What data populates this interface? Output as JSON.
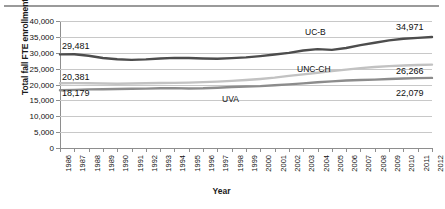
{
  "chart_data": {
    "type": "line",
    "title": "",
    "xlabel": "Year",
    "ylabel": "Total fall FTE enrollment",
    "ylim": [
      0,
      40000
    ],
    "ytick_labels": [
      "0",
      "5,000",
      "10,000",
      "15,000",
      "20,000",
      "25,000",
      "30,000",
      "35,000",
      "40,000"
    ],
    "ytick_values": [
      0,
      5000,
      10000,
      15000,
      20000,
      25000,
      30000,
      35000,
      40000
    ],
    "grid": true,
    "legend_position": "inline-annotations",
    "categories": [
      "1986",
      "1987",
      "1988",
      "1989",
      "1990",
      "1991",
      "1992",
      "1993",
      "1994",
      "1995",
      "1996",
      "1997",
      "1998",
      "1999",
      "2000",
      "2001",
      "2002",
      "2003",
      "2004",
      "2005",
      "2006",
      "2007",
      "2008",
      "2009",
      "2010",
      "2011",
      "2012"
    ],
    "series": [
      {
        "name": "UC-B",
        "color": "#4d4d4d",
        "values": [
          29481,
          29520,
          29050,
          28350,
          27950,
          27750,
          27900,
          28200,
          28380,
          28350,
          28200,
          28120,
          28300,
          28550,
          28950,
          29450,
          29950,
          30700,
          31150,
          30900,
          31500,
          32400,
          33150,
          33900,
          34400,
          34700,
          34971
        ]
      },
      {
        "name": "UNC-CH",
        "color": "#c2c2c2",
        "values": [
          20381,
          20420,
          20400,
          20300,
          20250,
          20300,
          20400,
          20450,
          20500,
          20600,
          20750,
          20900,
          21150,
          21400,
          21750,
          22150,
          22700,
          23200,
          23700,
          24200,
          24700,
          25150,
          25500,
          25800,
          26000,
          26150,
          26266
        ]
      },
      {
        "name": "UVA",
        "color": "#8c8c8c",
        "values": [
          18179,
          18300,
          18450,
          18500,
          18600,
          18650,
          18700,
          18800,
          18850,
          18750,
          18800,
          19000,
          19200,
          19350,
          19500,
          19750,
          20050,
          20350,
          20700,
          21000,
          21250,
          21400,
          21550,
          21750,
          21900,
          22000,
          22079
        ]
      }
    ],
    "annotations": [
      {
        "text": "29,481",
        "series": "UC-B",
        "position": "start"
      },
      {
        "text": "20,381",
        "series": "UNC-CH",
        "position": "start"
      },
      {
        "text": "18,179",
        "series": "UVA",
        "position": "start"
      },
      {
        "text": "34,971",
        "series": "UC-B",
        "position": "end"
      },
      {
        "text": "26,266",
        "series": "UNC-CH",
        "position": "end"
      },
      {
        "text": "22,079",
        "series": "UVA",
        "position": "end"
      },
      {
        "text": "UC-B",
        "series": "UC-B",
        "position": "inline"
      },
      {
        "text": "UNC-CH",
        "series": "UNC-CH",
        "position": "inline"
      },
      {
        "text": "UVA",
        "series": "UVA",
        "position": "inline"
      }
    ]
  },
  "axis": {
    "y_title": "Total fall FTE enrollment",
    "x_title": "Year"
  },
  "labels": {
    "start_ucb": "29,481",
    "start_unc": "20,381",
    "start_uva": "18,179",
    "end_ucb": "34,971",
    "end_unc": "26,266",
    "end_uva": "22,079",
    "name_ucb": "UC-B",
    "name_unc": "UNC-CH",
    "name_uva": "UVA"
  }
}
